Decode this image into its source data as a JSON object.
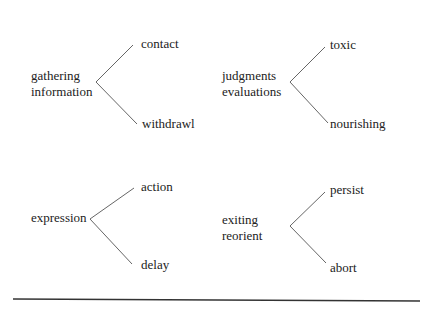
{
  "diagrams": [
    {
      "source": [
        "gathering",
        "information"
      ],
      "branches": [
        "contact",
        "withdrawl"
      ]
    },
    {
      "source": [
        "judgments",
        "evaluations"
      ],
      "branches": [
        "toxic",
        "nourishing"
      ]
    },
    {
      "source": [
        "expression"
      ],
      "branches": [
        "action",
        "delay"
      ]
    },
    {
      "source": [
        "exiting",
        "reorient"
      ],
      "branches": [
        "persist",
        "abort"
      ]
    }
  ],
  "colors": {
    "line": "#666666",
    "rule": "#333333",
    "text": "#222222"
  }
}
